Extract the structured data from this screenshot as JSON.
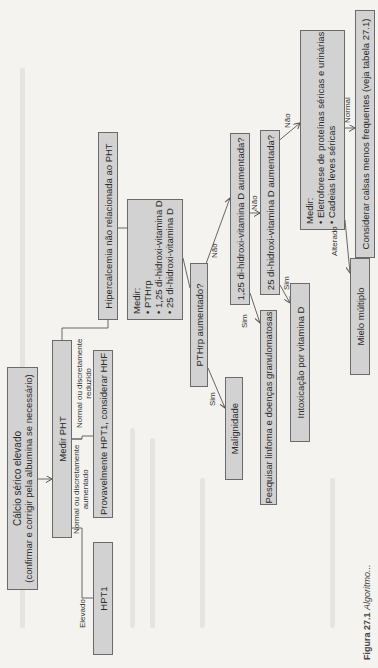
{
  "figure": {
    "caption_label": "Figura 27.1",
    "caption_text": "Algoritmo..."
  },
  "nodes": {
    "start": {
      "line1": "Cálcio sérico elevado",
      "line2": "(confirmar e corrigir pela albumina se necessário)"
    },
    "measure_pht": "Medir PHT",
    "hpt1": "HPT1",
    "probable_hpt1": "Provavelmente HPT1, considerar HHF",
    "non_pht": "Hipercalcemia não relacionada ao PHT",
    "measure_pthrp": {
      "title": "Medir:",
      "items": [
        "PTHrp",
        "1,25 di-hidroxi-vitamina D",
        "25 di-hidroxi-vitamina D"
      ]
    },
    "pthrp_question": "PTHrp aumentado?",
    "malignancy": "Malignidade",
    "d125_question": "1,25 di-hidroxi-vitamina D aumentada?",
    "lymphoma": "Pesquisar linfoma e doenças granulomatosas",
    "d25_question": "25 di-hidroxi-vitamina D aumentada?",
    "vitd_intox": "Intoxicação por vitamina D",
    "measure_electro": {
      "title": "Medir:",
      "items": [
        "Eletroforese de proteínas séricas e urinárias",
        "Cadeias leves séricas"
      ]
    },
    "myeloma": "Mielo múltiplo",
    "consider_other": "Considerar calsas menos frequentes (veja tabela 27.1)"
  },
  "edges": {
    "elevated": "Elevado",
    "normal_high": {
      "line1": "Normal ou discretamente",
      "line2": "aumentado"
    },
    "normal_low": {
      "line1": "Normal ou discretamente",
      "line2": "reduzido"
    },
    "pthrp_yes": "Sim",
    "pthrp_no": "Não",
    "d125_yes": "Sim",
    "d125_no": "Não",
    "d25_yes": "Sim",
    "d25_no": "Não",
    "electro_altered": "Alterado",
    "electro_normal": "Normal"
  }
}
